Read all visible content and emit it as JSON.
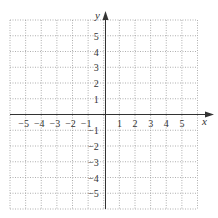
{
  "chart_data": {
    "type": "coordinate-grid",
    "title": "",
    "xlabel": "x",
    "ylabel": "y",
    "xlim": [
      -6,
      6
    ],
    "ylim": [
      -6,
      6
    ],
    "grid": "dotted",
    "x_tick_labels": [
      "−5",
      "−4",
      "−3",
      "−2",
      "−1",
      "1",
      "2",
      "3",
      "4",
      "5"
    ],
    "x_ticks": [
      -5,
      -4,
      -3,
      -2,
      -1,
      1,
      2,
      3,
      4,
      5
    ],
    "y_tick_labels": [
      "5",
      "4",
      "3",
      "2",
      "1",
      "−1",
      "−2",
      "−3",
      "−4",
      "−5"
    ],
    "y_ticks": [
      5,
      4,
      3,
      2,
      1,
      -1,
      -2,
      -3,
      -4,
      -5
    ],
    "series": []
  },
  "axes": {
    "x_label": "x",
    "y_label": "y"
  },
  "colors": {
    "grid": "#9a9a9a",
    "axis": "#333333",
    "text": "#333333"
  }
}
